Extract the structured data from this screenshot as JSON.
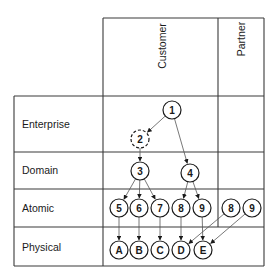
{
  "columns": [
    {
      "id": "customer",
      "label": "Customer"
    },
    {
      "id": "partner",
      "label": "Partner"
    }
  ],
  "rows": [
    {
      "id": "enterprise",
      "label": "Enterprise"
    },
    {
      "id": "domain",
      "label": "Domain"
    },
    {
      "id": "atomic",
      "label": "Atomic"
    },
    {
      "id": "physical",
      "label": "Physical"
    }
  ],
  "nodes": [
    {
      "id": "n1",
      "label": "1",
      "row": "enterprise",
      "column": "customer",
      "x": 172,
      "y": 110,
      "dashed": false
    },
    {
      "id": "n2",
      "label": "2",
      "row": "enterprise",
      "column": "customer",
      "x": 140,
      "y": 139,
      "dashed": true
    },
    {
      "id": "n3",
      "label": "3",
      "row": "domain",
      "column": "customer",
      "x": 140,
      "y": 171,
      "dashed": false
    },
    {
      "id": "n4",
      "label": "4",
      "row": "domain",
      "column": "customer",
      "x": 190,
      "y": 173,
      "dashed": false
    },
    {
      "id": "n5",
      "label": "5",
      "row": "atomic",
      "column": "customer",
      "x": 119,
      "y": 208,
      "dashed": false
    },
    {
      "id": "n6",
      "label": "6",
      "row": "atomic",
      "column": "customer",
      "x": 139,
      "y": 208,
      "dashed": false
    },
    {
      "id": "n7",
      "label": "7",
      "row": "atomic",
      "column": "customer",
      "x": 160,
      "y": 208,
      "dashed": false
    },
    {
      "id": "n8",
      "label": "8",
      "row": "atomic",
      "column": "customer",
      "x": 181,
      "y": 208,
      "dashed": false
    },
    {
      "id": "n9",
      "label": "9",
      "row": "atomic",
      "column": "customer",
      "x": 202,
      "y": 208,
      "dashed": false
    },
    {
      "id": "p8",
      "label": "8",
      "row": "atomic",
      "column": "partner",
      "x": 231,
      "y": 208,
      "dashed": false
    },
    {
      "id": "p9",
      "label": "9",
      "row": "atomic",
      "column": "partner",
      "x": 252,
      "y": 208,
      "dashed": false
    },
    {
      "id": "nA",
      "label": "A",
      "row": "physical",
      "column": "customer",
      "x": 119,
      "y": 250,
      "dashed": false
    },
    {
      "id": "nB",
      "label": "B",
      "row": "physical",
      "column": "customer",
      "x": 139,
      "y": 250,
      "dashed": false
    },
    {
      "id": "nC",
      "label": "C",
      "row": "physical",
      "column": "customer",
      "x": 160,
      "y": 250,
      "dashed": false
    },
    {
      "id": "nD",
      "label": "D",
      "row": "physical",
      "column": "customer",
      "x": 181,
      "y": 250,
      "dashed": false
    },
    {
      "id": "nE",
      "label": "E",
      "row": "physical",
      "column": "customer",
      "x": 203,
      "y": 250,
      "dashed": false
    }
  ],
  "edges": [
    {
      "from": "n1",
      "to": "n2"
    },
    {
      "from": "n1",
      "to": "n4"
    },
    {
      "from": "n2",
      "to": "n3"
    },
    {
      "from": "n3",
      "to": "n5"
    },
    {
      "from": "n3",
      "to": "n6"
    },
    {
      "from": "n3",
      "to": "n7"
    },
    {
      "from": "n4",
      "to": "n8"
    },
    {
      "from": "n4",
      "to": "n9"
    },
    {
      "from": "n5",
      "to": "nA"
    },
    {
      "from": "n6",
      "to": "nB"
    },
    {
      "from": "n7",
      "to": "nC"
    },
    {
      "from": "n8",
      "to": "nD"
    },
    {
      "from": "n9",
      "to": "nE"
    },
    {
      "from": "p8",
      "to": "nD"
    },
    {
      "from": "p9",
      "to": "nE"
    }
  ],
  "colors": {
    "line": "#3a3a3a",
    "text": "#1a1a1a",
    "edge": "#555555",
    "background": "#ffffff"
  }
}
